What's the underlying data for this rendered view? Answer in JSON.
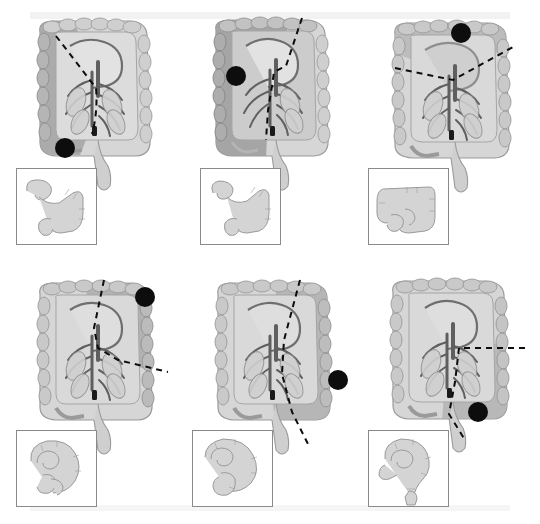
{
  "figure": {
    "type": "medical-illustration-grid",
    "rows": 2,
    "columns": 3,
    "background_color": "#ffffff",
    "band_color": "#f2f2f2"
  },
  "palette": {
    "colon_fill": "#c9c9c9",
    "colon_light": "#dcdcdc",
    "colon_outline": "#8e8e8e",
    "vessel_stroke": "#6e6e6e",
    "vessel_dark": "#5a5a5a",
    "resect_shade": "#9e9e9e",
    "resect_shade_dark": "#8f8f8f",
    "tumor_marker": "#101010",
    "dashed_line": "#101010",
    "inset_border": "#8a8a8a",
    "inset_fill": "#d2d2d2",
    "inset_outline": "#9a9a9a"
  },
  "panels": [
    {
      "id": "panel-a",
      "position": {
        "row": 1,
        "column": 1,
        "x": 0,
        "y": 0
      },
      "procedure_name": "Right hemicolectomy",
      "tumor_marker": {
        "name": "tumor-marker",
        "cx": 65,
        "cy": 148,
        "r": 10,
        "location": "ascending colon"
      },
      "resection_line": {
        "name": "resection-line",
        "style": "dashed",
        "shape": "oblique"
      },
      "shaded_region": {
        "name": "resected-segment-shading",
        "side": "left",
        "label": "resected segment"
      },
      "inset": {
        "name": "inset-postop-anatomy",
        "x": 16,
        "y": 168,
        "width": 79,
        "height": 75,
        "caption": "remaining colon after anastomosis",
        "shape": "ileo-transverse anastomosis"
      }
    },
    {
      "id": "panel-b",
      "position": {
        "row": 1,
        "column": 2,
        "x": 180,
        "y": 0
      },
      "procedure_name": "Extended right hemicolectomy",
      "tumor_marker": {
        "name": "tumor-marker",
        "cx": 236,
        "cy": 76,
        "r": 10,
        "location": "hepatic flexure"
      },
      "resection_line": {
        "name": "resection-line",
        "style": "dashed",
        "shape": "vertical-stepped"
      },
      "shaded_region": {
        "name": "resected-segment-shading",
        "side": "left-wide",
        "label": "resected segment"
      },
      "inset": {
        "name": "inset-postop-anatomy",
        "x": 200,
        "y": 168,
        "width": 79,
        "height": 75,
        "caption": "remaining colon after anastomosis",
        "shape": "ileo-descending anastomosis"
      }
    },
    {
      "id": "panel-c",
      "position": {
        "row": 1,
        "column": 3,
        "x": 355,
        "y": 0
      },
      "procedure_name": "Transverse colectomy",
      "tumor_marker": {
        "name": "tumor-marker",
        "cx": 461,
        "cy": 33,
        "r": 10,
        "location": "transverse colon"
      },
      "resection_line": {
        "name": "resection-line",
        "style": "dashed",
        "shape": "inverted-v"
      },
      "shaded_region": {
        "name": "resected-segment-shading",
        "side": "top",
        "label": "resected segment"
      },
      "inset": {
        "name": "inset-postop-anatomy",
        "x": 368,
        "y": 168,
        "width": 79,
        "height": 75,
        "caption": "remaining colon after anastomosis",
        "shape": "ascending-descending anastomosis"
      }
    },
    {
      "id": "panel-d",
      "position": {
        "row": 2,
        "column": 1,
        "x": 0,
        "y": 262
      },
      "procedure_name": "Left hemicolectomy",
      "tumor_marker": {
        "name": "tumor-marker",
        "cx": 145,
        "cy": 297,
        "r": 10,
        "location": "splenic flexure"
      },
      "resection_line": {
        "name": "resection-line",
        "style": "dashed",
        "shape": "oblique-right"
      },
      "shaded_region": {
        "name": "resected-segment-shading",
        "side": "right",
        "label": "resected segment"
      },
      "inset": {
        "name": "inset-postop-anatomy",
        "x": 16,
        "y": 430,
        "width": 79,
        "height": 75,
        "caption": "remaining colon after anastomosis",
        "shape": "transverse-sigmoid anastomosis"
      }
    },
    {
      "id": "panel-e",
      "position": {
        "row": 2,
        "column": 2,
        "x": 180,
        "y": 262
      },
      "procedure_name": "Extended left hemicolectomy",
      "tumor_marker": {
        "name": "tumor-marker",
        "cx": 338,
        "cy": 380,
        "r": 10,
        "location": "descending colon"
      },
      "resection_line": {
        "name": "resection-line",
        "style": "dashed",
        "shape": "vertical-oblique"
      },
      "shaded_region": {
        "name": "resected-segment-shading",
        "side": "right-wide",
        "label": "resected segment"
      },
      "inset": {
        "name": "inset-postop-anatomy",
        "x": 192,
        "y": 430,
        "width": 79,
        "height": 75,
        "caption": "remaining colon after anastomosis",
        "shape": "transverse-rectal anastomosis"
      }
    },
    {
      "id": "panel-f",
      "position": {
        "row": 2,
        "column": 3,
        "x": 355,
        "y": 262
      },
      "procedure_name": "Sigmoid colectomy",
      "tumor_marker": {
        "name": "tumor-marker",
        "cx": 478,
        "cy": 412,
        "r": 10,
        "location": "sigmoid colon"
      },
      "resection_line": {
        "name": "resection-line",
        "style": "dashed",
        "shape": "horizontal-then-down"
      },
      "shaded_region": {
        "name": "resected-segment-shading",
        "side": "lower-right",
        "label": "resected segment"
      },
      "inset": {
        "name": "inset-postop-anatomy",
        "x": 368,
        "y": 430,
        "width": 79,
        "height": 75,
        "caption": "remaining colon after anastomosis",
        "shape": "descending-rectal anastomosis"
      }
    }
  ]
}
